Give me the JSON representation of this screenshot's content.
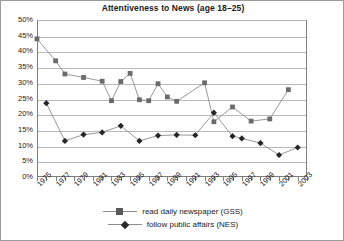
{
  "chart_data": {
    "type": "line",
    "title": "Attentiveness to News (age 18–25)",
    "xlabel": "",
    "ylabel": "",
    "ylim": [
      0,
      50
    ],
    "ytick_step": 5,
    "ytick_labels": [
      "50%",
      "45%",
      "40%",
      "35%",
      "30%",
      "25%",
      "20%",
      "15%",
      "10%",
      "5%",
      "0%"
    ],
    "xlim": [
      1975,
      2004
    ],
    "grid": true,
    "legend_position": "bottom",
    "marker_color_gss": "#6b6b6b",
    "marker_color_nes": "#262626",
    "line_color": "#8d8d8d",
    "x_tick_labels": [
      "1975",
      "1977",
      "1979",
      "1981",
      "1983",
      "1985",
      "1987",
      "1989",
      "1991",
      "1993",
      "1995",
      "1997",
      "1999",
      "2001",
      "2003"
    ],
    "series": [
      {
        "name": "read daily newspaper (GSS)",
        "marker": "square",
        "points": [
          {
            "x": 1975,
            "y": 44.0
          },
          {
            "x": 1977,
            "y": 37.0
          },
          {
            "x": 1978,
            "y": 32.8
          },
          {
            "x": 1980,
            "y": 31.7
          },
          {
            "x": 1982,
            "y": 30.5
          },
          {
            "x": 1983,
            "y": 24.3
          },
          {
            "x": 1984,
            "y": 30.4
          },
          {
            "x": 1985,
            "y": 33.0
          },
          {
            "x": 1986,
            "y": 24.6
          },
          {
            "x": 1987,
            "y": 24.3
          },
          {
            "x": 1988,
            "y": 29.7
          },
          {
            "x": 1989,
            "y": 25.5
          },
          {
            "x": 1990,
            "y": 24.1
          },
          {
            "x": 1993,
            "y": 30.0
          },
          {
            "x": 1994,
            "y": 17.6
          },
          {
            "x": 1996,
            "y": 22.3
          },
          {
            "x": 1998,
            "y": 17.8
          },
          {
            "x": 2000,
            "y": 18.5
          },
          {
            "x": 2002,
            "y": 27.8
          }
        ]
      },
      {
        "name": "follow public affairs (NES)",
        "marker": "diamond",
        "points": [
          {
            "x": 1976,
            "y": 23.5
          },
          {
            "x": 1978,
            "y": 11.5
          },
          {
            "x": 1980,
            "y": 13.5
          },
          {
            "x": 1982,
            "y": 14.2
          },
          {
            "x": 1984,
            "y": 16.3
          },
          {
            "x": 1986,
            "y": 11.5
          },
          {
            "x": 1988,
            "y": 13.2
          },
          {
            "x": 1990,
            "y": 13.4
          },
          {
            "x": 1992,
            "y": 13.3
          },
          {
            "x": 1994,
            "y": 20.5
          },
          {
            "x": 1996,
            "y": 13.0
          },
          {
            "x": 1997,
            "y": 12.3
          },
          {
            "x": 1999,
            "y": 10.8
          },
          {
            "x": 2001,
            "y": 7.0
          },
          {
            "x": 2003,
            "y": 9.4
          }
        ]
      }
    ]
  },
  "legend": {
    "items": [
      {
        "label": "read daily newspaper (GSS)",
        "marker": "square"
      },
      {
        "label": "follow public affairs (NES)",
        "marker": "diamond"
      }
    ]
  }
}
